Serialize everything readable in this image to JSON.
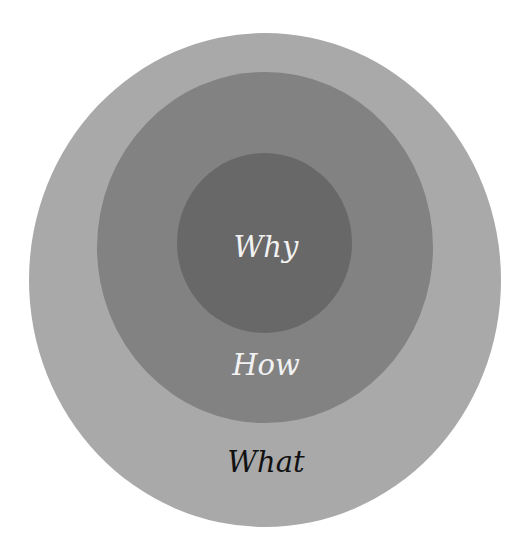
{
  "diagram": {
    "type": "golden-circle",
    "rings": [
      {
        "id": "outer",
        "label": "What",
        "color": "#a9a9a9",
        "text_color": "#111111"
      },
      {
        "id": "middle",
        "label": "How",
        "color": "#828282",
        "text_color": "#f2f2f2"
      },
      {
        "id": "inner",
        "label": "Why",
        "color": "#686868",
        "text_color": "#f2f2f2"
      }
    ]
  }
}
